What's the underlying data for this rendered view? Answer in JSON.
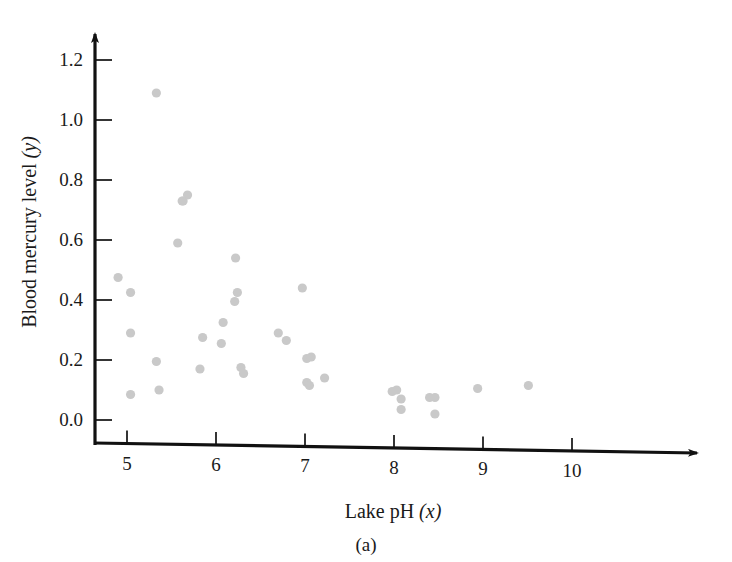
{
  "figure": {
    "caption": "(a)",
    "point_color": "#c9c9c9",
    "axis_color": "#111111"
  },
  "chart_data": {
    "type": "scatter",
    "title": "",
    "xlabel": "Lake pH",
    "xlabel_var": "(x)",
    "ylabel": "Blood mercury level",
    "ylabel_var": "(y)",
    "xlim": [
      4.55,
      10.4
    ],
    "ylim": [
      -0.09,
      1.3
    ],
    "xticks": [
      5,
      6,
      7,
      8,
      9,
      10
    ],
    "xtick_labels": [
      "5",
      "6",
      "7",
      "8",
      "9",
      "10"
    ],
    "yticks": [
      0.0,
      0.2,
      0.4,
      0.6,
      0.8,
      1.0,
      1.2
    ],
    "ytick_labels": [
      "0.0",
      "0.2",
      "0.4",
      "0.6",
      "0.8",
      "1.0",
      "1.2"
    ],
    "grid": false,
    "legend": false,
    "n_points": 37,
    "points": [
      [
        4.9,
        0.475
      ],
      [
        5.04,
        0.425
      ],
      [
        5.04,
        0.29
      ],
      [
        5.04,
        0.085
      ],
      [
        5.33,
        1.09
      ],
      [
        5.33,
        0.195
      ],
      [
        5.36,
        0.1
      ],
      [
        5.57,
        0.59
      ],
      [
        5.63,
        0.73
      ],
      [
        5.68,
        0.75
      ],
      [
        5.85,
        0.275
      ],
      [
        5.82,
        0.17
      ],
      [
        6.06,
        0.255
      ],
      [
        6.08,
        0.325
      ],
      [
        6.21,
        0.395
      ],
      [
        6.24,
        0.425
      ],
      [
        6.22,
        0.54
      ],
      [
        6.28,
        0.175
      ],
      [
        6.31,
        0.155
      ],
      [
        6.7,
        0.29
      ],
      [
        6.79,
        0.265
      ],
      [
        6.97,
        0.44
      ],
      [
        7.02,
        0.205
      ],
      [
        7.07,
        0.21
      ],
      [
        7.02,
        0.125
      ],
      [
        7.05,
        0.115
      ],
      [
        7.22,
        0.14
      ],
      [
        7.98,
        0.095
      ],
      [
        8.03,
        0.1
      ],
      [
        8.08,
        0.07
      ],
      [
        8.08,
        0.035
      ],
      [
        8.4,
        0.075
      ],
      [
        8.46,
        0.075
      ],
      [
        8.46,
        0.02
      ],
      [
        8.94,
        0.105
      ],
      [
        9.51,
        0.115
      ],
      [
        5.62,
        0.73
      ]
    ]
  }
}
